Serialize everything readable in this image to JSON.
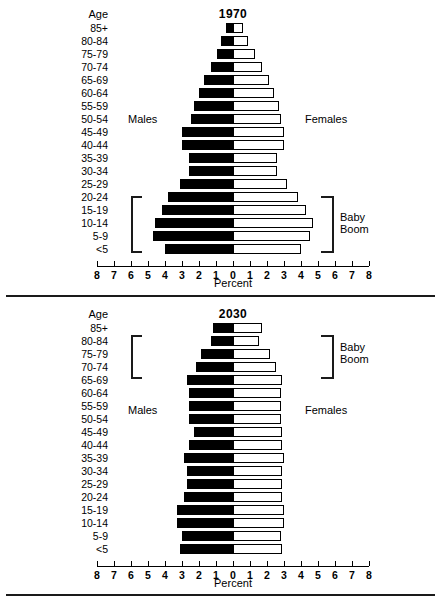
{
  "figure": {
    "age_header": "Age",
    "axis_title": "Percent",
    "males_label": "Males",
    "females_label": "Females",
    "baby_boom_label_line1": "Baby",
    "baby_boom_label_line2": "Boom",
    "age_groups": [
      "85+",
      "80-84",
      "75-79",
      "70-74",
      "65-69",
      "60-64",
      "55-59",
      "50-54",
      "45-49",
      "40-44",
      "35-39",
      "30-34",
      "25-29",
      "20-24",
      "15-19",
      "10-14",
      "5-9",
      "<5"
    ],
    "tick_labels": [
      "8",
      "7",
      "6",
      "5",
      "4",
      "3",
      "2",
      "1",
      "0",
      "1",
      "2",
      "3",
      "4",
      "5",
      "6",
      "7",
      "8"
    ],
    "colors": {
      "male_fill": "#000000",
      "female_fill": "#ffffff",
      "outline": "#000000"
    }
  },
  "chart_data": [
    {
      "type": "bar",
      "title": "1970",
      "subtype": "population-pyramid",
      "xlabel": "Percent",
      "ylabel": "Age",
      "xlim": [
        -8,
        8
      ],
      "grid": false,
      "annotation": "Baby Boom bracket spans age groups 5-9 through 20-24 on both sides",
      "categories": [
        "85+",
        "80-84",
        "75-79",
        "70-74",
        "65-69",
        "60-64",
        "55-59",
        "50-54",
        "45-49",
        "40-44",
        "35-39",
        "30-34",
        "25-29",
        "20-24",
        "15-19",
        "10-14",
        "5-9",
        "<5"
      ],
      "series": [
        {
          "name": "Males",
          "values": [
            0.4,
            0.7,
            0.95,
            1.3,
            1.7,
            2.0,
            2.3,
            2.5,
            3.0,
            3.0,
            2.6,
            2.6,
            3.1,
            3.8,
            4.2,
            4.6,
            4.7,
            4.0
          ]
        },
        {
          "name": "Females",
          "values": [
            0.6,
            0.9,
            1.3,
            1.7,
            2.1,
            2.4,
            2.7,
            2.8,
            3.0,
            3.0,
            2.6,
            2.6,
            3.2,
            3.8,
            4.3,
            4.7,
            4.5,
            4.0
          ]
        }
      ]
    },
    {
      "type": "bar",
      "title": "2030",
      "subtype": "population-pyramid",
      "xlabel": "Percent",
      "ylabel": "Age",
      "xlim": [
        -8,
        8
      ],
      "grid": false,
      "annotation": "Baby Boom bracket spans age groups 65-69 through 80-84 on both sides",
      "categories": [
        "85+",
        "80-84",
        "75-79",
        "70-74",
        "65-69",
        "60-64",
        "55-59",
        "50-54",
        "45-49",
        "40-44",
        "35-39",
        "30-34",
        "25-29",
        "20-24",
        "15-19",
        "10-14",
        "5-9",
        "<5"
      ],
      "series": [
        {
          "name": "Males",
          "values": [
            1.2,
            1.3,
            1.9,
            2.2,
            2.7,
            2.6,
            2.6,
            2.6,
            2.3,
            2.6,
            2.9,
            2.7,
            2.7,
            2.9,
            3.3,
            3.3,
            3.0,
            3.1
          ]
        },
        {
          "name": "Females",
          "values": [
            1.7,
            1.5,
            2.2,
            2.5,
            2.9,
            2.8,
            2.8,
            2.8,
            2.9,
            2.9,
            3.0,
            2.9,
            2.9,
            2.9,
            3.0,
            3.0,
            2.8,
            2.9
          ]
        }
      ]
    }
  ]
}
